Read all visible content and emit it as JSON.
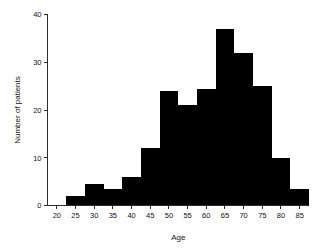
{
  "chart_data": {
    "type": "bar",
    "title": "",
    "subtitle": "",
    "xlabel": "Age",
    "ylabel": "Number of patients",
    "grid": false,
    "legend": "none",
    "bar_color": "#000000",
    "axis_color": "#2b2b2b",
    "bin_width": 5,
    "xlim": [
      17.5,
      87.5
    ],
    "ylim": [
      0,
      40
    ],
    "xticks": [
      20,
      25,
      30,
      35,
      40,
      45,
      50,
      55,
      60,
      65,
      70,
      75,
      80,
      85
    ],
    "xtick_labels": [
      "20",
      "25",
      "30",
      "35",
      "40",
      "45",
      "50",
      "55",
      "60",
      "65",
      "70",
      "75",
      "80",
      "85"
    ],
    "yticks": [
      0,
      10,
      20,
      30,
      40
    ],
    "ytick_labels": [
      "0",
      "10",
      "20",
      "30",
      "40"
    ],
    "bins": [
      {
        "label": "17.5-22.5",
        "start": 17.5,
        "end": 22.5,
        "value": 0
      },
      {
        "label": "22.5-27.5",
        "start": 22.5,
        "end": 27.5,
        "value": 2
      },
      {
        "label": "27.5-32.5",
        "start": 27.5,
        "end": 32.5,
        "value": 4.5
      },
      {
        "label": "32.5-37.5",
        "start": 32.5,
        "end": 37.5,
        "value": 3.5
      },
      {
        "label": "37.5-42.5",
        "start": 37.5,
        "end": 42.5,
        "value": 6
      },
      {
        "label": "42.5-47.5",
        "start": 42.5,
        "end": 47.5,
        "value": 12
      },
      {
        "label": "47.5-52.5",
        "start": 47.5,
        "end": 52.5,
        "value": 24
      },
      {
        "label": "52.5-57.5",
        "start": 52.5,
        "end": 57.5,
        "value": 21
      },
      {
        "label": "57.5-62.5",
        "start": 57.5,
        "end": 62.5,
        "value": 24.5
      },
      {
        "label": "62.5-67.5",
        "start": 62.5,
        "end": 67.5,
        "value": 37
      },
      {
        "label": "67.5-72.5",
        "start": 67.5,
        "end": 72.5,
        "value": 32
      },
      {
        "label": "72.5-77.5",
        "start": 72.5,
        "end": 77.5,
        "value": 25
      },
      {
        "label": "77.5-82.5",
        "start": 77.5,
        "end": 82.5,
        "value": 10
      },
      {
        "label": "82.5-87.5",
        "start": 82.5,
        "end": 87.5,
        "value": 3.5
      }
    ],
    "categories": [
      "17.5-22.5",
      "22.5-27.5",
      "27.5-32.5",
      "32.5-37.5",
      "37.5-42.5",
      "42.5-47.5",
      "47.5-52.5",
      "52.5-57.5",
      "57.5-62.5",
      "62.5-67.5",
      "67.5-72.5",
      "72.5-77.5",
      "77.5-82.5",
      "82.5-87.5"
    ],
    "values": [
      0,
      2,
      4.5,
      3.5,
      6,
      12,
      24,
      21,
      24.5,
      37,
      32,
      25,
      10,
      3.5
    ]
  }
}
